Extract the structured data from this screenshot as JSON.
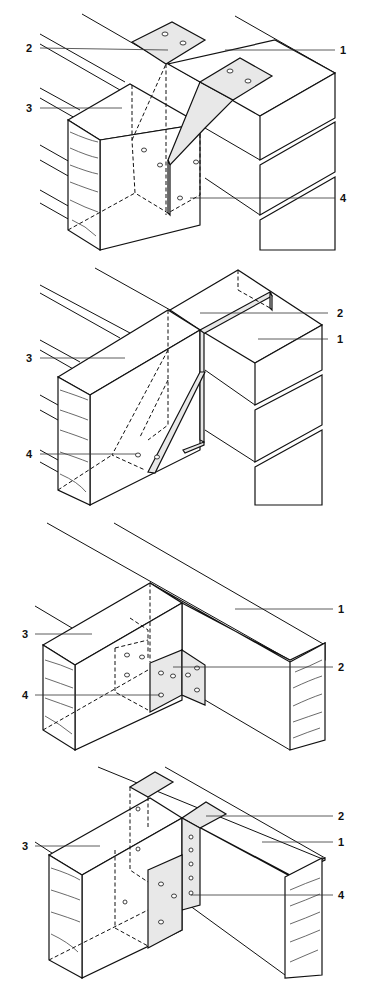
{
  "figure": {
    "panels": [
      {
        "id": "a",
        "description": "Top-flange joist hanger built into masonry wall",
        "labels": [
          {
            "num": "1",
            "target": "masonry wall"
          },
          {
            "num": "2",
            "target": "hanger top flange"
          },
          {
            "num": "3",
            "target": "timber joist"
          },
          {
            "num": "4",
            "target": "nail hole"
          }
        ]
      },
      {
        "id": "b",
        "description": "Strap-type joist hanger hooked over masonry block",
        "labels": [
          {
            "num": "2",
            "target": "hanger strap"
          },
          {
            "num": "1",
            "target": "masonry wall"
          },
          {
            "num": "3",
            "target": "timber joist"
          },
          {
            "num": "4",
            "target": "nail hole"
          }
        ]
      },
      {
        "id": "c",
        "description": "Face-fixed angle bracket joist-to-beam connection",
        "labels": [
          {
            "num": "1",
            "target": "timber beam"
          },
          {
            "num": "3",
            "target": "timber joist"
          },
          {
            "num": "2",
            "target": "angle bracket"
          },
          {
            "num": "4",
            "target": "nail hole"
          }
        ]
      },
      {
        "id": "d",
        "description": "Top-flange joist hanger over timber beam",
        "labels": [
          {
            "num": "2",
            "target": "hanger top flange"
          },
          {
            "num": "3",
            "target": "timber joist"
          },
          {
            "num": "1",
            "target": "timber beam"
          },
          {
            "num": "4",
            "target": "nail hole"
          }
        ]
      }
    ]
  },
  "colors": {
    "line": "#111111",
    "background": "#ffffff"
  }
}
